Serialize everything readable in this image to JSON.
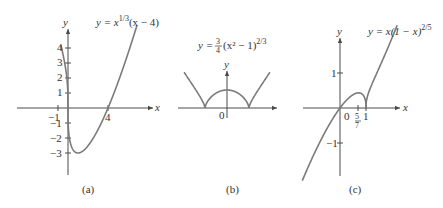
{
  "figure": {
    "panels": [
      {
        "id": "a",
        "caption": "(a)",
        "equation": {
          "lhs": "y = x",
          "exp": "1/3",
          "rhs": "(x − 4)"
        },
        "axis_labels": {
          "x": "x",
          "y": "y"
        },
        "x_ticks": [
          "−1",
          "4"
        ],
        "y_ticks": [
          "4",
          "3",
          "2",
          "1",
          "−1",
          "−2",
          "−3"
        ]
      },
      {
        "id": "b",
        "caption": "(b)",
        "equation": {
          "lhs": "y = ",
          "frac_num": "3",
          "frac_den": "4",
          "rhs": "(x² − 1)",
          "exp": "2/3"
        },
        "axis_labels": {
          "x": "x",
          "y": "y"
        },
        "origin_label": "0"
      },
      {
        "id": "c",
        "caption": "(c)",
        "equation": {
          "lhs": "y = x(1 − x)",
          "exp": "2/5"
        },
        "axis_labels": {
          "x": "x",
          "y": "y"
        },
        "x_ticks": {
          "origin": "0",
          "frac_num": "5",
          "frac_den": "7",
          "one": "1"
        },
        "y_ticks": [
          "1",
          "−1"
        ]
      }
    ]
  },
  "chart_data": [
    {
      "type": "line",
      "title": "y = x^(1/3)(x − 4)",
      "xlabel": "x",
      "ylabel": "y",
      "x_ticks": [
        -1,
        4
      ],
      "y_ticks": [
        4,
        3,
        2,
        1,
        -1,
        -2,
        -3
      ],
      "xlim": [
        -5,
        8.5
      ],
      "ylim": [
        -4.5,
        5.3
      ],
      "key_points": [
        {
          "x": 0,
          "y": 0,
          "note": "vertical tangent"
        },
        {
          "x": 1,
          "y": -3,
          "note": "minimum"
        },
        {
          "x": 4,
          "y": 0,
          "note": "x-intercept"
        }
      ],
      "grid": false
    },
    {
      "type": "line",
      "title": "y = (3/4)(x² − 1)^(2/3)",
      "xlabel": "x",
      "ylabel": "y",
      "xlim": [
        -2.2,
        2.3
      ],
      "ylim": [
        -0.4,
        1.6
      ],
      "key_points": [
        {
          "x": -1,
          "y": 0,
          "note": "cusp"
        },
        {
          "x": 0,
          "y": 0.75,
          "note": "local max"
        },
        {
          "x": 1,
          "y": 0,
          "note": "cusp"
        }
      ],
      "grid": false
    },
    {
      "type": "line",
      "title": "y = x(1 − x)^(2/5)",
      "xlabel": "x",
      "ylabel": "y",
      "x_ticks": [
        "0",
        "5/7",
        "1"
      ],
      "y_ticks": [
        1,
        -1
      ],
      "xlim": [
        -1.5,
        2.6
      ],
      "ylim": [
        -2,
        2.5
      ],
      "key_points": [
        {
          "x": 0.714,
          "y": 0.43,
          "note": "local max"
        },
        {
          "x": 1,
          "y": 0,
          "note": "cusp"
        }
      ],
      "grid": false
    }
  ]
}
